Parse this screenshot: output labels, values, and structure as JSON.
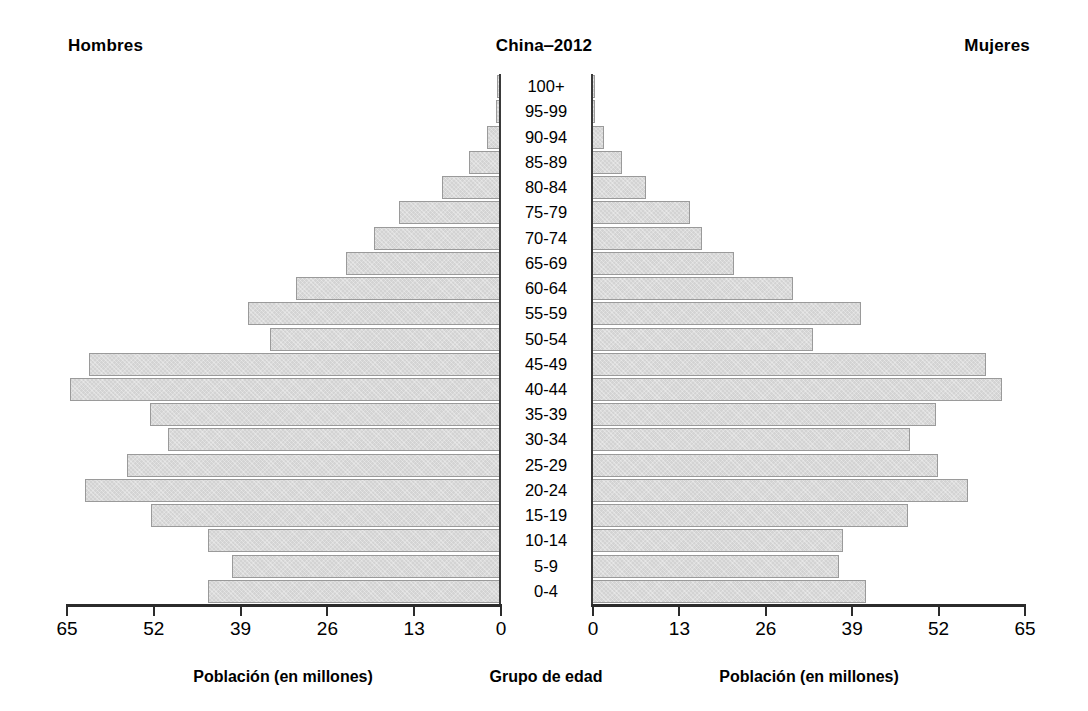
{
  "header": {
    "left_label": "Hombres",
    "title": "China‒2012",
    "right_label": "Mujeres"
  },
  "captions": {
    "left": "Población (en millones)",
    "middle": "Grupo de edad",
    "right": "Población (en millones)"
  },
  "axis": {
    "left_ticks": [
      "65",
      "52",
      "39",
      "26",
      "13",
      "0"
    ],
    "right_ticks": [
      "0",
      "13",
      "26",
      "39",
      "52",
      "65"
    ],
    "tick_values": [
      0,
      13,
      26,
      39,
      52,
      65
    ],
    "max": 65
  },
  "style": {
    "bar_fill": "#d3d3d3",
    "bar_border": "#9a9a9a",
    "axis_color": "#2b2b2b",
    "background": "#ffffff",
    "text_color": "#000000"
  },
  "chart_data": {
    "type": "bar",
    "subtype": "population-pyramid",
    "title": "China‒2012",
    "xlabel": "Población (en millones)",
    "ylabel": "Grupo de edad",
    "xlim": [
      0,
      65
    ],
    "grid": false,
    "legend_position": "top",
    "units": "millones de personas",
    "categories": [
      "100+",
      "95-99",
      "90-94",
      "85-89",
      "80-84",
      "75-79",
      "70-74",
      "65-69",
      "60-64",
      "55-59",
      "50-54",
      "45-49",
      "40-44",
      "35-39",
      "30-34",
      "25-29",
      "20-24",
      "15-19",
      "10-14",
      "5-9",
      "0-4"
    ],
    "series": [
      {
        "name": "Hombres",
        "side": "left",
        "values": [
          0.4,
          0.6,
          1.9,
          4.7,
          8.7,
          15.2,
          18.8,
          23.1,
          30.5,
          37.7,
          34.5,
          61.5,
          64.4,
          52.4,
          49.7,
          55.8,
          62.1,
          52.3,
          43.7,
          40.1,
          43.8
        ]
      },
      {
        "name": "Mujeres",
        "side": "right",
        "values": [
          0.4,
          0.5,
          1.8,
          4.5,
          8.2,
          14.8,
          16.5,
          21.4,
          30.3,
          40.4,
          33.3,
          59.3,
          61.7,
          51.7,
          47.9,
          52.1,
          56.5,
          47.6,
          37.7,
          37.2,
          41.3
        ]
      }
    ]
  }
}
